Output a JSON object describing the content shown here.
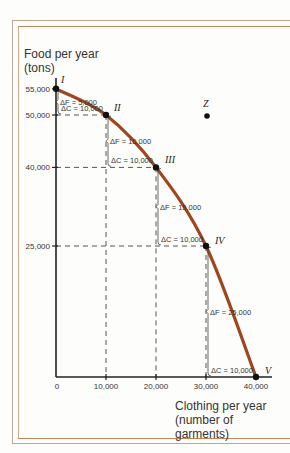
{
  "chart_data": {
    "type": "line",
    "title": "",
    "xlabel": "Clothing per year (number of garments)",
    "ylabel": "Food per year (tons)",
    "xlabel_lines": [
      "Clothing per year",
      "(number of garments)"
    ],
    "ylabel_lines": [
      "Food per year",
      "(tons)"
    ],
    "x_ticks": [
      "0",
      "10,000",
      "20,000",
      "30,000",
      "40,000"
    ],
    "y_ticks": [
      "55,000",
      "50,000",
      "40,000",
      "25,000"
    ],
    "xlim": [
      0,
      40000
    ],
    "ylim": [
      0,
      55000
    ],
    "series": [
      {
        "name": "Production possibilities frontier",
        "color": "#a0461e",
        "points": [
          {
            "label": "I",
            "x": 0,
            "y": 55000
          },
          {
            "label": "II",
            "x": 10000,
            "y": 50000
          },
          {
            "label": "III",
            "x": 20000,
            "y": 40000
          },
          {
            "label": "IV",
            "x": 30000,
            "y": 25000
          },
          {
            "label": "V",
            "x": 40000,
            "y": 0
          }
        ]
      }
    ],
    "extra_points": [
      {
        "label": "Z",
        "x": 30000,
        "y": 48500,
        "note": "unattainable point outside frontier"
      }
    ],
    "annotations": [
      {
        "text": "ΔF = 5,000",
        "between": [
          "I",
          "II"
        ]
      },
      {
        "text": "ΔC = 10,000",
        "between": [
          "I",
          "II"
        ]
      },
      {
        "text": "ΔF = 10,000",
        "between": [
          "II",
          "III"
        ]
      },
      {
        "text": "ΔC = 10,000",
        "between": [
          "II",
          "III"
        ]
      },
      {
        "text": "ΔF = 15,000",
        "between": [
          "III",
          "IV"
        ]
      },
      {
        "text": "ΔC = 10,000",
        "between": [
          "III",
          "IV"
        ]
      },
      {
        "text": "ΔF = 25,000",
        "between": [
          "IV",
          "V"
        ]
      },
      {
        "text": "ΔC = 10,000",
        "between": [
          "IV",
          "V"
        ]
      }
    ],
    "grid": false,
    "legend": null
  }
}
